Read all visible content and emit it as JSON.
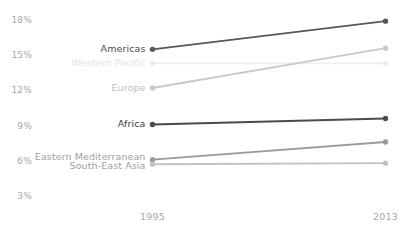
{
  "chart_data": {
    "type": "line",
    "title": "",
    "xlabel": "",
    "ylabel": "",
    "x": [
      "1995",
      "2013"
    ],
    "xtick_labels": [
      "1995",
      "2013"
    ],
    "ytick_labels": [
      "18%",
      "15%",
      "12%",
      "9%",
      "6%",
      "3%"
    ],
    "ytick_values": [
      18,
      15,
      12,
      9,
      6,
      3
    ],
    "ylim": [
      3,
      18
    ],
    "grid": false,
    "legend_position": "inline-left",
    "value_suffix": "%",
    "series": [
      {
        "name": "Americas",
        "values": [
          15.5,
          17.9
        ],
        "color": "#58585a",
        "label_color": "#4a4a4a",
        "label_y": 15.5
      },
      {
        "name": "Western Pacific",
        "values": [
          14.3,
          14.3
        ],
        "color": "#ededed",
        "label_color": "#e2e2e2",
        "label_y": 14.3
      },
      {
        "name": "Europe",
        "values": [
          12.2,
          15.6
        ],
        "color": "#c9c9c9",
        "label_color": "#bdbdbd",
        "label_y": 12.2
      },
      {
        "name": "Africa",
        "values": [
          9.1,
          9.6
        ],
        "color": "#4b4b4d",
        "label_color": "#3f3f3f",
        "label_y": 9.1
      },
      {
        "name": "Eastern Mediterranean",
        "values": [
          6.1,
          7.6
        ],
        "color": "#9b9b9b",
        "label_color": "#a0a0a0",
        "label_y": 6.35
      },
      {
        "name": "South-East Asia",
        "values": [
          5.7,
          5.8
        ],
        "color": "#c2c2c2",
        "label_color": "#a0a0a0",
        "label_y": 5.55
      }
    ]
  },
  "axis": {
    "tick_color": "#a8a8a8"
  }
}
